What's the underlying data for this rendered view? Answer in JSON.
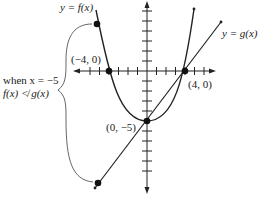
{
  "diagram": {
    "type": "function-graph",
    "curves": [
      {
        "name": "f",
        "label": "y = f(x)",
        "kind": "parabola"
      },
      {
        "name": "g",
        "label": "y = g(x)",
        "kind": "line"
      }
    ],
    "points": [
      {
        "label": "(−4, 0)",
        "x": -4,
        "y": 0
      },
      {
        "label": "(4, 0)",
        "x": 4,
        "y": 0
      },
      {
        "label": "(0, −5)",
        "x": 0,
        "y": -5
      }
    ],
    "annotation": {
      "line1": "when x = −5",
      "line2": "f(x) ≮ g(x)"
    },
    "labels": {
      "f_label": "y = f(x)",
      "g_label": "y = g(x)",
      "p_neg4": "(−4, 0)",
      "p_pos4": "(4, 0)",
      "p_0neg5": "(0, −5)",
      "when": "when x = −5",
      "ineq": "f(x) ≮ g(x)"
    },
    "colors": {
      "stroke": "#222222",
      "background": "#ffffff",
      "brace": "#555555"
    }
  }
}
